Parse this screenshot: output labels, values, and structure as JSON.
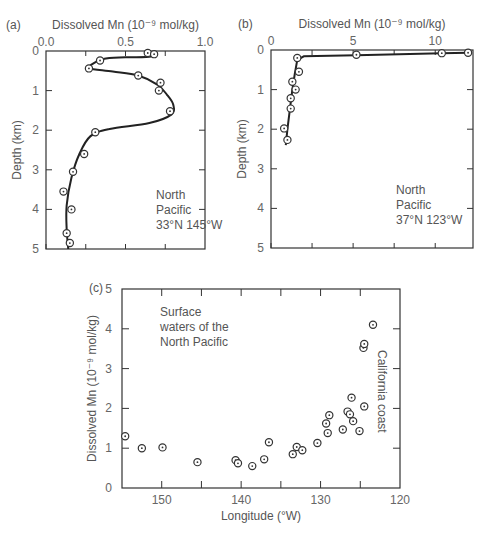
{
  "chart_data": [
    {
      "id": "a",
      "panel_label": "(a)",
      "type": "line",
      "title": "",
      "xlabel": "Dissolved Mn (10⁻⁹ mol/kg)",
      "ylabel": "Depth (km)",
      "xlim": [
        0.0,
        1.0
      ],
      "ylim": [
        0,
        5
      ],
      "y_inverted": true,
      "x_axis_position": "top",
      "xticks": [
        "0.0",
        "0.5",
        "1.0"
      ],
      "yticks": [
        "0",
        "1",
        "2",
        "3",
        "4",
        "5"
      ],
      "annotation": [
        "North",
        "Pacific",
        "33°N 145°W"
      ],
      "points": [
        {
          "mn": 0.64,
          "depth": 0.05
        },
        {
          "mn": 0.68,
          "depth": 0.08
        },
        {
          "mn": 0.34,
          "depth": 0.24
        },
        {
          "mn": 0.27,
          "depth": 0.44
        },
        {
          "mn": 0.58,
          "depth": 0.62
        },
        {
          "mn": 0.72,
          "depth": 0.8
        },
        {
          "mn": 0.71,
          "depth": 1.0
        },
        {
          "mn": 0.78,
          "depth": 1.52
        },
        {
          "mn": 0.31,
          "depth": 2.05
        },
        {
          "mn": 0.24,
          "depth": 2.6
        },
        {
          "mn": 0.17,
          "depth": 3.05
        },
        {
          "mn": 0.11,
          "depth": 3.55
        },
        {
          "mn": 0.16,
          "depth": 4.0
        },
        {
          "mn": 0.13,
          "depth": 4.6
        },
        {
          "mn": 0.15,
          "depth": 4.85
        }
      ],
      "curve": [
        [
          0.66,
          0.0
        ],
        [
          0.66,
          0.14
        ],
        [
          0.5,
          0.16
        ],
        [
          0.36,
          0.2
        ],
        [
          0.28,
          0.36
        ],
        [
          0.27,
          0.44
        ],
        [
          0.42,
          0.52
        ],
        [
          0.58,
          0.62
        ],
        [
          0.7,
          0.85
        ],
        [
          0.76,
          1.1
        ],
        [
          0.8,
          1.35
        ],
        [
          0.79,
          1.6
        ],
        [
          0.65,
          1.82
        ],
        [
          0.4,
          1.97
        ],
        [
          0.28,
          2.15
        ],
        [
          0.21,
          2.6
        ],
        [
          0.16,
          3.2
        ],
        [
          0.13,
          3.9
        ],
        [
          0.13,
          4.5
        ],
        [
          0.14,
          5.0
        ]
      ]
    },
    {
      "id": "b",
      "panel_label": "(b)",
      "type": "line",
      "title": "",
      "xlabel": "Dissolved Mn (10⁻⁹ mol/kg)",
      "ylabel": "Depth (km)",
      "xlim": [
        0,
        12.3
      ],
      "ylim": [
        0,
        5
      ],
      "y_inverted": true,
      "x_axis_position": "top",
      "xticks": [
        "0",
        "5",
        "10"
      ],
      "yticks": [
        "0",
        "1",
        "2",
        "3",
        "4",
        "5"
      ],
      "annotation": [
        "North",
        "Pacific",
        "37°N 123°W"
      ],
      "points": [
        {
          "mn": 12.0,
          "depth": 0.07
        },
        {
          "mn": 10.4,
          "depth": 0.08
        },
        {
          "mn": 5.2,
          "depth": 0.12
        },
        {
          "mn": 1.6,
          "depth": 0.2
        },
        {
          "mn": 1.7,
          "depth": 0.55
        },
        {
          "mn": 1.3,
          "depth": 0.8
        },
        {
          "mn": 1.5,
          "depth": 1.0
        },
        {
          "mn": 1.2,
          "depth": 1.22
        },
        {
          "mn": 1.2,
          "depth": 1.48
        },
        {
          "mn": 0.8,
          "depth": 1.98
        },
        {
          "mn": 1.0,
          "depth": 2.27
        }
      ],
      "curve": [
        [
          12.0,
          0.07
        ],
        [
          10.4,
          0.08
        ],
        [
          5.2,
          0.13
        ],
        [
          2.0,
          0.16
        ],
        [
          1.6,
          0.25
        ],
        [
          1.45,
          0.6
        ],
        [
          1.3,
          1.0
        ],
        [
          1.15,
          1.5
        ],
        [
          1.0,
          2.0
        ],
        [
          0.9,
          2.4
        ]
      ]
    },
    {
      "id": "c",
      "panel_label": "(c)",
      "type": "scatter",
      "title": "",
      "xlabel": "Longitude (°W)",
      "ylabel": "Dissolved Mn (10⁻⁹ mol/kg)",
      "xlim": [
        155,
        120
      ],
      "ylim": [
        0,
        5
      ],
      "x_reversed": true,
      "xticks": [
        "150",
        "140",
        "130",
        "120"
      ],
      "yticks": [
        "0",
        "1",
        "2",
        "3",
        "4",
        "5"
      ],
      "annotations": [
        "Surface waters of the North Pacific",
        "California coast"
      ],
      "points": [
        {
          "lon": 154.6,
          "mn": 1.3
        },
        {
          "lon": 152.5,
          "mn": 1.0
        },
        {
          "lon": 149.9,
          "mn": 1.02
        },
        {
          "lon": 145.5,
          "mn": 0.65
        },
        {
          "lon": 140.7,
          "mn": 0.7
        },
        {
          "lon": 140.4,
          "mn": 0.62
        },
        {
          "lon": 138.6,
          "mn": 0.55
        },
        {
          "lon": 137.1,
          "mn": 0.72
        },
        {
          "lon": 136.5,
          "mn": 1.15
        },
        {
          "lon": 133.5,
          "mn": 0.85
        },
        {
          "lon": 133.0,
          "mn": 1.03
        },
        {
          "lon": 132.3,
          "mn": 0.95
        },
        {
          "lon": 130.4,
          "mn": 1.13
        },
        {
          "lon": 129.1,
          "mn": 1.38
        },
        {
          "lon": 129.3,
          "mn": 1.62
        },
        {
          "lon": 128.9,
          "mn": 1.83
        },
        {
          "lon": 127.2,
          "mn": 1.47
        },
        {
          "lon": 126.6,
          "mn": 1.92
        },
        {
          "lon": 126.3,
          "mn": 1.85
        },
        {
          "lon": 126.1,
          "mn": 2.27
        },
        {
          "lon": 125.9,
          "mn": 1.68
        },
        {
          "lon": 125.1,
          "mn": 1.43
        },
        {
          "lon": 124.5,
          "mn": 2.05
        },
        {
          "lon": 124.6,
          "mn": 3.52
        },
        {
          "lon": 124.5,
          "mn": 3.62
        },
        {
          "lon": 123.4,
          "mn": 4.1
        }
      ]
    }
  ]
}
